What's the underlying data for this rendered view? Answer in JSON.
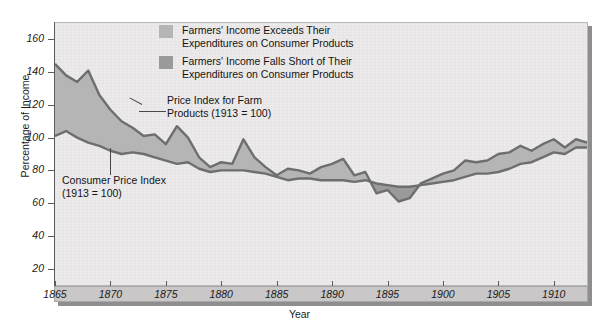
{
  "chart_data": {
    "type": "area",
    "title": "",
    "xlabel": "Year",
    "ylabel": "Percentage of Income",
    "xlim": [
      1865,
      1913
    ],
    "ylim": [
      10,
      170
    ],
    "yticks": [
      20,
      40,
      60,
      80,
      100,
      120,
      140,
      160
    ],
    "xticks": [
      1865,
      1870,
      1875,
      1880,
      1885,
      1890,
      1895,
      1900,
      1905,
      1910
    ],
    "grid": false,
    "legend_position": "top-center",
    "x": [
      1865,
      1866,
      1867,
      1868,
      1869,
      1870,
      1871,
      1872,
      1873,
      1874,
      1875,
      1876,
      1877,
      1878,
      1879,
      1880,
      1881,
      1882,
      1883,
      1884,
      1885,
      1886,
      1887,
      1888,
      1889,
      1890,
      1891,
      1892,
      1893,
      1894,
      1895,
      1896,
      1897,
      1898,
      1899,
      1900,
      1901,
      1902,
      1903,
      1904,
      1905,
      1906,
      1907,
      1908,
      1909,
      1910,
      1911,
      1912,
      1913
    ],
    "series": [
      {
        "name": "Price Index for Farm Products (1913 = 100)",
        "color": "#6e6e6e",
        "values": [
          145,
          138,
          134,
          141,
          126,
          117,
          110,
          106,
          101,
          102,
          96,
          107,
          100,
          88,
          82,
          85,
          84,
          99,
          88,
          82,
          77,
          81,
          80,
          78,
          82,
          84,
          87,
          77,
          79,
          66,
          68,
          61,
          63,
          72,
          75,
          78,
          80,
          86,
          85,
          86,
          90,
          91,
          95,
          92,
          96,
          99,
          94,
          99,
          97
        ]
      },
      {
        "name": "Consumer Price Index (1913 = 100)",
        "color": "#6e6e6e",
        "values": [
          101,
          104,
          100,
          97,
          95,
          92,
          90,
          91,
          90,
          88,
          86,
          84,
          85,
          81,
          79,
          80,
          80,
          80,
          79,
          78,
          76,
          74,
          75,
          75,
          74,
          74,
          74,
          73,
          74,
          72,
          71,
          70,
          70,
          71,
          72,
          73,
          74,
          76,
          78,
          78,
          79,
          81,
          84,
          85,
          88,
          91,
          90,
          94,
          94
        ]
      }
    ],
    "legend": [
      {
        "label": "Farmers' Income Exceeds Their\nExpenditures on Consumer Products",
        "color": "#b5b5b5",
        "swatch": "above"
      },
      {
        "label": "Farmers' Income Falls Short of Their\nExpenditures on Consumer Products",
        "color": "#9a9a9a",
        "swatch": "below"
      }
    ],
    "annotations": [
      {
        "text": "Price Index for Farm\nProducts (1913 = 100)",
        "name": "farm-index-annotation"
      },
      {
        "text": "Consumer Price Index\n(1913 = 100)",
        "name": "cpi-annotation"
      }
    ]
  },
  "axes": {
    "y_label": "Percentage of Income",
    "x_label": "Year",
    "y_ticks": [
      "160",
      "140",
      "120",
      "100",
      "80",
      "60",
      "40",
      "20"
    ],
    "x_ticks": [
      "1865",
      "1870",
      "1875",
      "1880",
      "1885",
      "1890",
      "1895",
      "1900",
      "1905",
      "1910"
    ]
  },
  "colors": {
    "plot_background": "#eceaea",
    "line": "#6e6e6e",
    "fill_above": "#b5b5b5",
    "fill_below": "#9a9a9a",
    "axis": "#5c5c5c",
    "band": "#c9c7c7"
  }
}
